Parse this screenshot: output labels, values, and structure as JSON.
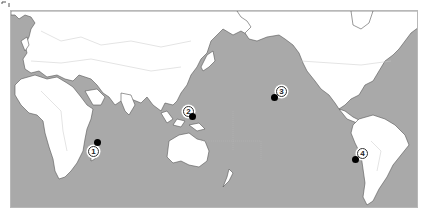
{
  "map": {
    "projection": "world map centered on the Pacific Ocean",
    "colors": {
      "ocean": "#a9a9a9",
      "land": "#ffffff",
      "border": "#c8c8c8",
      "coast": "#555555",
      "marker": "#000000"
    },
    "markers": [
      {
        "id": 1,
        "label": "1",
        "region": "Western Indian Ocean, east of Africa"
      },
      {
        "id": 2,
        "label": "2",
        "region": "Western Pacific, east of the Philippines"
      },
      {
        "id": 3,
        "label": "3",
        "region": "Central North Pacific"
      },
      {
        "id": 4,
        "label": "4",
        "region": "South Pacific, west of South America"
      }
    ]
  }
}
